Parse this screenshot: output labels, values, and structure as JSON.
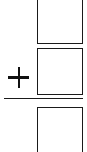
{
  "problem": {
    "type": "vertical-addition",
    "operator": "+",
    "operator_label": "plus",
    "addend_1": "",
    "addend_2": "",
    "sum": ""
  },
  "colors": {
    "stroke": "#1a1a1a",
    "background": "#ffffff"
  }
}
